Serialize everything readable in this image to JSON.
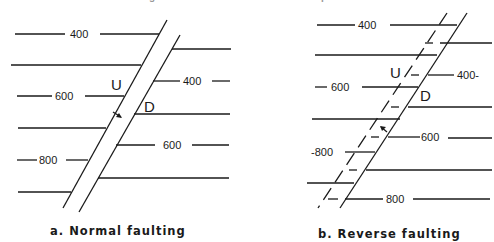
{
  "header": {
    "text": "Fig. — Faults on structure contour maps."
  },
  "panel_a": {
    "caption": "a.   Normal faulting",
    "upthrown": "U",
    "downthrown": "D",
    "left_labels": [
      "400",
      "600",
      "800"
    ],
    "right_labels": [
      "400",
      "600"
    ]
  },
  "panel_b": {
    "caption": "b.   Reverse faulting",
    "upthrown": "U",
    "downthrown": "D",
    "left_labels": [
      "400",
      "600",
      "-800"
    ],
    "right_labels": [
      "400-",
      "600",
      "800"
    ]
  },
  "colors": {
    "ink": "#1a1a1a",
    "paper": "#ffffff"
  }
}
